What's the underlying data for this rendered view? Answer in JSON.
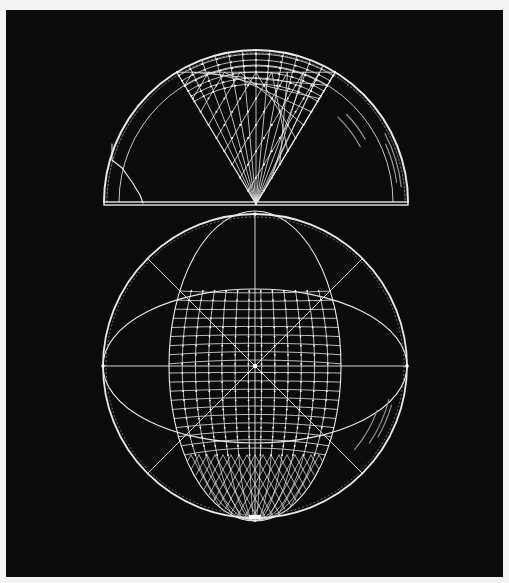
{
  "figure": {
    "background_color": "#0b0b0b",
    "page_color": "#f4f4f4",
    "line_color": "#e8e8e8",
    "faint_line_color": "#9a9a9a"
  },
  "top_hemisphere": {
    "cx": 256,
    "cy": 202,
    "r": 152,
    "inner_r": 137,
    "baseline_y": 203,
    "wedge": {
      "apex": [
        256,
        204
      ],
      "half_angle_deg": 31
    },
    "latitude_arcs": [
      134,
      128,
      122,
      116,
      110,
      104
    ],
    "lattice_rows": 10,
    "meridian_count": 13,
    "left_crack": [
      [
        112,
        160
      ],
      [
        122,
        168
      ],
      [
        132,
        182
      ],
      [
        140,
        195
      ],
      [
        143,
        203
      ]
    ],
    "faint_arcs": [
      {
        "r": 118,
        "a0": 28,
        "a1": 46
      },
      {
        "r": 126,
        "a0": 30,
        "a1": 44
      },
      {
        "r": 146,
        "a0": 6,
        "a1": 28
      },
      {
        "r": 142,
        "a0": 8,
        "a1": 24
      }
    ]
  },
  "bottom_sphere": {
    "cx": 255,
    "cy": 366,
    "r": 152,
    "vertical_ellipse": {
      "rx": 86,
      "ry": 155
    },
    "horizontal_ellipse": {
      "rx": 152,
      "ry": 77
    },
    "grid_rows": 18,
    "grid_cols": 13,
    "lattice_start_y": 455,
    "diagonals": true,
    "faint_arcs": [
      {
        "r": 130,
        "a0": 20,
        "a1": 40
      },
      {
        "r": 138,
        "a0": 14,
        "a1": 34
      },
      {
        "r": 142,
        "a0": 16,
        "a1": 30
      }
    ]
  }
}
